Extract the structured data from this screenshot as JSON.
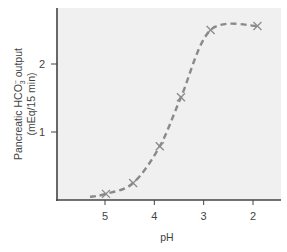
{
  "chart_data": {
    "type": "line",
    "title": "",
    "xlabel": "pH",
    "ylabel_line1": "Pancreatic HCO",
    "ylabel_sub": "3",
    "ylabel_sup": "−",
    "ylabel_line1_suffix": " output",
    "ylabel_line2": "(mEq/15 min)",
    "xlim": [
      6.0,
      1.5
    ],
    "x_reversed": true,
    "ylim": [
      0,
      2.8
    ],
    "xticks": [
      5,
      4,
      3,
      2
    ],
    "xtick_labels": [
      "5",
      "4",
      "3",
      "2"
    ],
    "yticks": [
      1,
      2
    ],
    "ytick_labels": [
      "1",
      "2"
    ],
    "grid": false,
    "legend": "none",
    "series": [
      {
        "name": "Pancreatic HCO3- output",
        "marker": "x",
        "line_style": "dashed",
        "x": [
          4.98,
          4.43,
          3.89,
          3.46,
          2.86,
          1.91
        ],
        "y": [
          0.09,
          0.25,
          0.79,
          1.51,
          2.5,
          2.56
        ]
      }
    ],
    "colors": {
      "plot_background": "#f0f0f0",
      "axis": "#444444",
      "series_line": "#8a8a8a",
      "marker": "#8a8a8a"
    }
  }
}
